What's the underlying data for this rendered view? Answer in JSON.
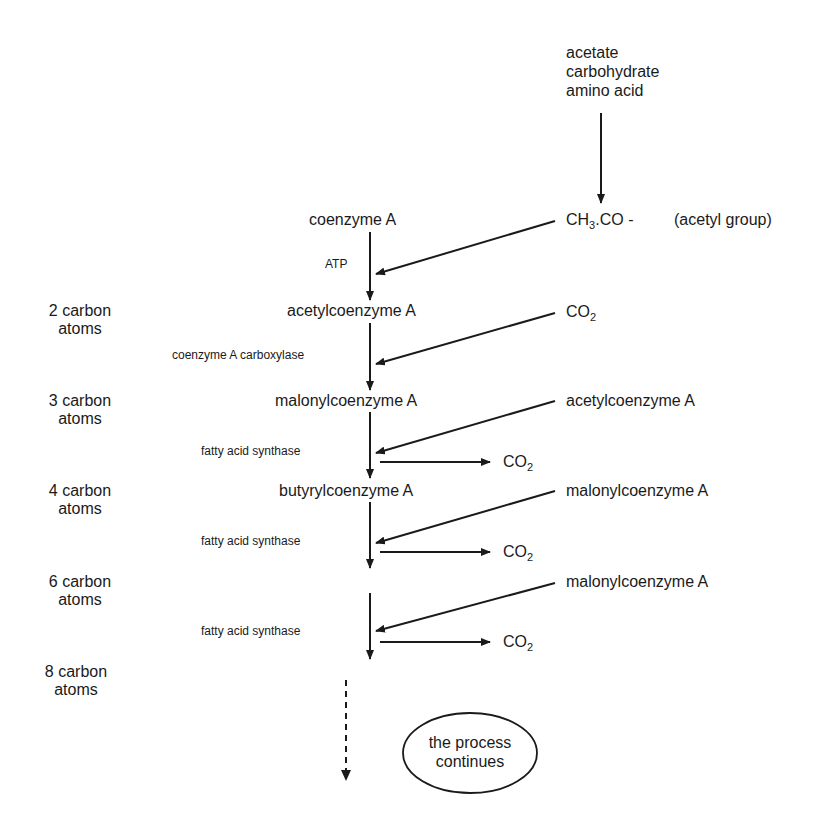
{
  "diagram": {
    "sources": {
      "lines": [
        "acetate",
        "carbohydrate",
        "amino acid"
      ]
    },
    "acetyl_group": {
      "formula_prefix": "CH",
      "formula_sub": "3",
      "formula_suffix": ".CO -",
      "note": "(acetyl group)"
    },
    "main_chain": [
      {
        "label": "coenzyme A"
      },
      {
        "label": "acetylcoenzyme A"
      },
      {
        "label": "malonylcoenzyme A"
      },
      {
        "label": "butyrylcoenzyme A"
      }
    ],
    "enzymes": [
      {
        "label": "ATP"
      },
      {
        "label": "coenzyme A carboxylase"
      },
      {
        "label": "fatty acid synthase"
      },
      {
        "label": "fatty acid synthase"
      },
      {
        "label": "fatty acid synthase"
      }
    ],
    "inputs": [
      {
        "prefix": "CO",
        "sub": "2"
      },
      {
        "label": "acetylcoenzyme A"
      },
      {
        "label": "malonylcoenzyme A"
      },
      {
        "label": "malonylcoenzyme A"
      }
    ],
    "outputs": [
      {
        "prefix": "CO",
        "sub": "2"
      },
      {
        "prefix": "CO",
        "sub": "2"
      },
      {
        "prefix": "CO",
        "sub": "2"
      }
    ],
    "carbon_counts": [
      {
        "line1": "2 carbon",
        "line2": "atoms"
      },
      {
        "line1": "3 carbon",
        "line2": "atoms"
      },
      {
        "line1": "4 carbon",
        "line2": "atoms"
      },
      {
        "line1": "6 carbon",
        "line2": "atoms"
      },
      {
        "line1": "8 carbon",
        "line2": "atoms"
      }
    ],
    "continuation": {
      "line1": "the process",
      "line2": "continues"
    }
  },
  "colors": {
    "ink": "#1a1a1a",
    "background": "#ffffff"
  }
}
